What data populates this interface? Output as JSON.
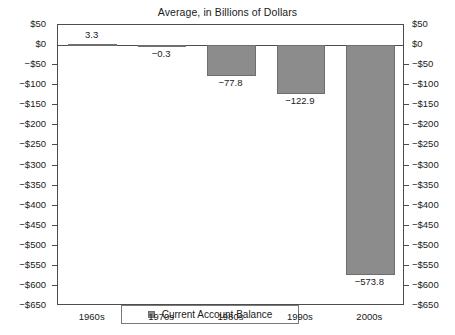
{
  "chart_data": {
    "type": "bar",
    "title": "Average, in Billions of Dollars",
    "xlabel": "",
    "ylabel": "",
    "categories": [
      "1960s",
      "1970s",
      "1980s",
      "1990s",
      "2000s"
    ],
    "values": [
      3.3,
      -0.3,
      -77.8,
      -122.9,
      -573.8
    ],
    "value_labels": [
      "3.3",
      "−0.3",
      "−77.8",
      "−122.9",
      "−573.8"
    ],
    "series": [
      {
        "name": "Current Account Balance",
        "color": "#8c8c8c",
        "values": [
          3.3,
          -0.3,
          -77.8,
          -122.9,
          -573.8
        ]
      }
    ],
    "ylim": [
      -650,
      50
    ],
    "ytick_step": 50,
    "ytick_values": [
      50,
      0,
      -50,
      -100,
      -150,
      -200,
      -250,
      -300,
      -350,
      -400,
      -450,
      -500,
      -550,
      -600,
      -650
    ],
    "ytick_labels_left": [
      "$50",
      "$0",
      "−$50",
      "−$100",
      "−$150",
      "−$200",
      "−$250",
      "−$300",
      "−$350",
      "−$400",
      "−$450",
      "−$500",
      "−$550",
      "−$600",
      "−$650"
    ],
    "ytick_labels_right": [
      "$50",
      "$0",
      "−$50",
      "−$100",
      "−$150",
      "−$200",
      "−$250",
      "−$300",
      "−$350",
      "−$400",
      "−$450",
      "−$500",
      "−$550",
      "−$600",
      "−$650"
    ],
    "grid": false,
    "dual_axis": true,
    "legend_position": "bottom-left-inside",
    "legend_entries": [
      "Current Account Balance"
    ]
  },
  "legend": {
    "label": "Current Account Balance"
  }
}
